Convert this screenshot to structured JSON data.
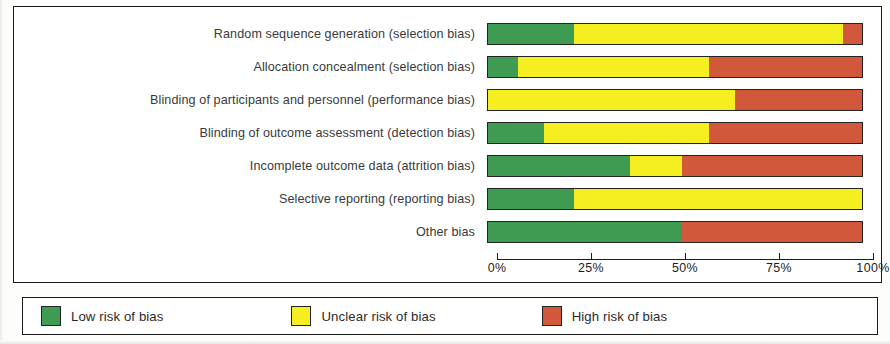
{
  "chart_data": {
    "type": "bar",
    "orientation": "horizontal",
    "stacked": true,
    "title": "",
    "xlabel": "",
    "ylabel": "",
    "xlim": [
      0,
      100
    ],
    "grid": false,
    "legend_position": "bottom",
    "tick_labels": [
      "0%",
      "25%",
      "50%",
      "75%",
      "100%"
    ],
    "tick_values": [
      0,
      25,
      50,
      75,
      100
    ],
    "categories": [
      "Random sequence generation (selection bias)",
      "Allocation concealment (selection bias)",
      "Blinding of participants and personnel (performance bias)",
      "Blinding of outcome assessment (detection bias)",
      "Incomplete outcome data (attrition bias)",
      "Selective reporting (reporting bias)",
      "Other bias"
    ],
    "series": [
      {
        "name": "Low risk of bias",
        "color": "#3f9b51",
        "values": [
          23,
          8,
          0,
          15,
          38,
          23,
          52
        ]
      },
      {
        "name": "Unclear risk of bias",
        "color": "#f5ee21",
        "values": [
          72,
          51,
          66,
          44,
          14,
          77,
          0
        ]
      },
      {
        "name": "High risk of bias",
        "color": "#d1583a",
        "values": [
          5,
          41,
          34,
          41,
          48,
          0,
          48
        ]
      }
    ],
    "legend": [
      {
        "label": "Low risk of bias",
        "color": "#3f9b51"
      },
      {
        "label": "Unclear risk of bias",
        "color": "#f5ee21"
      },
      {
        "label": "High risk of bias",
        "color": "#d1583a"
      }
    ]
  }
}
